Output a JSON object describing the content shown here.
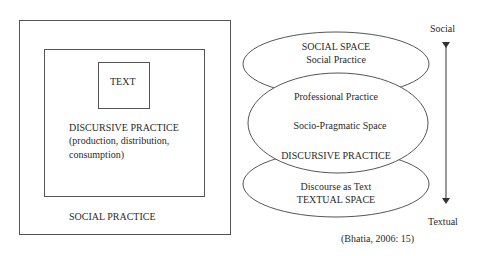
{
  "left_diagram": {
    "outer_label": "SOCIAL PRACTICE",
    "middle_label_lines": [
      "DISCURSIVE PRACTICE",
      "(production, distribution,",
      "consumption)"
    ],
    "inner_label": "TEXT"
  },
  "right_diagram": {
    "top_ellipse": {
      "line1": "SOCIAL SPACE",
      "line2": "Social Practice"
    },
    "middle_ellipse": {
      "line1": "Professional Practice",
      "line2": "Socio-Pragmatic Space",
      "line3": "DISCURSIVE PRACTICE"
    },
    "bottom_ellipse": {
      "line1": "Discourse as Text",
      "line2": "TEXTUAL SPACE"
    },
    "axis": {
      "top_label": "Social",
      "bottom_label": "Textual"
    },
    "citation": "(Bhatia, 2006: 15)"
  },
  "colors": {
    "line": "#555555",
    "text": "#2a2a2a"
  }
}
